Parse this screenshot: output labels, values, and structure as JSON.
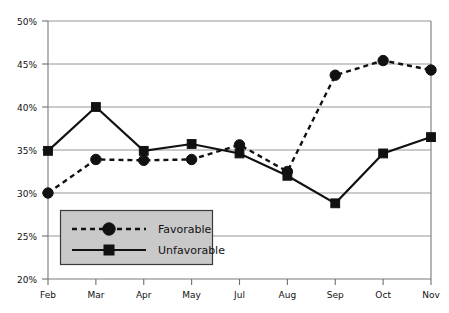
{
  "chart_data": {
    "type": "line",
    "title": "",
    "xlabel": "",
    "ylabel": "",
    "categories": [
      "Feb",
      "Mar",
      "Apr",
      "May",
      "Jul",
      "Aug",
      "Sep",
      "Oct",
      "Nov"
    ],
    "ylim": [
      20,
      50
    ],
    "ytick_values": [
      20,
      25,
      30,
      35,
      40,
      45,
      50
    ],
    "ytick_labels": [
      "20%",
      "25%",
      "30%",
      "35%",
      "40%",
      "45%",
      "50%"
    ],
    "grid": "horizontal",
    "legend_position": "inside-lower-left",
    "series": [
      {
        "name": "Favorable",
        "marker": "circle",
        "line_style": "dashed",
        "color": "#111111",
        "values": [
          30.0,
          33.9,
          33.8,
          33.9,
          35.6,
          32.5,
          43.7,
          45.4,
          44.3
        ]
      },
      {
        "name": "Unfavorable",
        "marker": "square",
        "line_style": "solid",
        "color": "#111111",
        "values": [
          34.9,
          40.0,
          34.9,
          35.7,
          34.6,
          32.0,
          28.8,
          34.6,
          36.5
        ]
      }
    ]
  },
  "legend": {
    "entries": [
      {
        "label": "Favorable",
        "style": "dashed-circle"
      },
      {
        "label": "Unfavorable",
        "style": "solid-square"
      }
    ]
  },
  "axes": {
    "y_axis_name": "percentage-axis",
    "x_axis_name": "month-axis"
  }
}
